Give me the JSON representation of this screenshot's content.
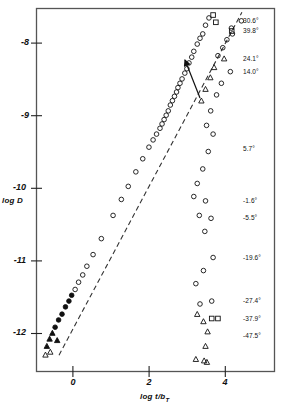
{
  "chart_data": {
    "type": "scatter",
    "title": "",
    "xlabel": "log t/bT",
    "xlabel_main": "log t/b",
    "xlabel_sub": "T",
    "ylabel": "log D",
    "xlim": [
      -1.6,
      5.3
    ],
    "ylim": [
      -12.45,
      -7.45
    ],
    "xticks": [
      0,
      2,
      4
    ],
    "xtick_labels": [
      "0",
      "2",
      "4"
    ],
    "yticks": [
      -8,
      -9,
      -10,
      -11,
      -12
    ],
    "ytick_labels": [
      "-8",
      "-9",
      "-10",
      "-11",
      "-12"
    ],
    "grid": false,
    "legend_position": "right-inside",
    "annotations": [
      {
        "name": "master-curve-arrow",
        "text": "",
        "x": 3.05,
        "y": -7.85
      }
    ],
    "master_curve": {
      "name": "master curve",
      "style": "dashed",
      "x": [
        -1.35,
        3.45
      ],
      "y": [
        -12.3,
        -7.5
      ]
    },
    "series": [
      {
        "name": "30.6",
        "label": "30.6°",
        "label_y": -7.62,
        "marker": "circle",
        "points": [
          [
            4.34,
            -7.62
          ],
          [
            4.05,
            -7.72
          ],
          [
            4.08,
            -7.8
          ],
          [
            3.92,
            -7.88
          ],
          [
            3.8,
            -7.99
          ],
          [
            3.66,
            -8.1
          ]
        ]
      },
      {
        "name": "39.8",
        "label": "39.8°",
        "label_y": -7.76,
        "marker": "square",
        "points": [
          [
            3.52,
            -7.54
          ],
          [
            4.06,
            -7.76
          ],
          [
            3.6,
            -7.64
          ]
        ]
      },
      {
        "name": "24.1",
        "label": "24.1°",
        "label_y": -8.14,
        "marker": "triangle",
        "points": [
          [
            3.84,
            -8.14
          ],
          [
            3.55,
            -8.26
          ],
          [
            3.44,
            -8.4
          ],
          [
            3.3,
            -8.56
          ],
          [
            3.18,
            -8.72
          ]
        ]
      },
      {
        "name": "14.0",
        "label": "14.0°",
        "label_y": -8.32,
        "marker": "circle",
        "points": [
          [
            4.02,
            -8.32
          ],
          [
            3.76,
            -8.48
          ],
          [
            3.62,
            -8.64
          ],
          [
            3.45,
            -8.86
          ],
          [
            3.33,
            -9.06
          ]
        ]
      },
      {
        "name": "5.7",
        "label": "5.7°",
        "label_y": -9.38,
        "marker": "circle",
        "points": [
          [
            3.52,
            -9.18
          ],
          [
            3.38,
            -9.42
          ],
          [
            3.22,
            -9.66
          ],
          [
            3.06,
            -9.86
          ],
          [
            2.96,
            -10.04
          ]
        ]
      },
      {
        "name": "-1.6",
        "label": "-1.6°",
        "label_y": -10.1,
        "marker": "circle",
        "points": [
          [
            3.3,
            -10.1
          ],
          [
            3.12,
            -10.3
          ]
        ]
      },
      {
        "name": "-5.5",
        "label": "-5.5°",
        "label_y": -10.34,
        "marker": "circle",
        "points": [
          [
            3.46,
            -10.34
          ],
          [
            3.28,
            -10.52
          ]
        ]
      },
      {
        "name": "-19.6",
        "label": "-19.6°",
        "label_y": -10.88,
        "marker": "circle",
        "points": [
          [
            3.52,
            -10.88
          ],
          [
            3.24,
            -11.06
          ],
          [
            3.02,
            -11.24
          ]
        ]
      },
      {
        "name": "-27.4",
        "label": "-27.4°",
        "label_y": -11.48,
        "marker": "circle",
        "points": [
          [
            3.48,
            -11.48
          ],
          [
            3.14,
            -11.52
          ]
        ]
      },
      {
        "name": "-37.9",
        "label": "-37.9°",
        "label_y": -11.72,
        "marker": "square",
        "points": [
          [
            3.48,
            -11.72
          ],
          [
            3.66,
            -11.72
          ]
        ]
      },
      {
        "name": "-47.5",
        "label": "-47.5°",
        "label_y": -11.96,
        "marker": "triangle",
        "points": [
          [
            3.06,
            -11.66
          ],
          [
            3.24,
            -11.76
          ],
          [
            3.36,
            -11.9
          ],
          [
            3.3,
            -12.1
          ],
          [
            3.02,
            -12.28
          ],
          [
            3.26,
            -12.3
          ],
          [
            3.34,
            -12.32
          ]
        ]
      }
    ],
    "overlay_points": {
      "name": "collapsed master data",
      "marker": "mixed open/filled circles and triangles",
      "points": [
        [
          3.4,
          -7.58
        ],
        [
          3.3,
          -7.68
        ],
        [
          3.22,
          -7.8
        ],
        [
          3.14,
          -7.86
        ],
        [
          3.06,
          -7.94
        ],
        [
          2.96,
          -8.04
        ],
        [
          2.9,
          -8.12
        ],
        [
          2.82,
          -8.2
        ],
        [
          2.76,
          -8.28
        ],
        [
          2.7,
          -8.34
        ],
        [
          2.62,
          -8.42
        ],
        [
          2.56,
          -8.48
        ],
        [
          2.5,
          -8.54
        ],
        [
          2.46,
          -8.6
        ],
        [
          2.4,
          -8.66
        ],
        [
          2.34,
          -8.72
        ],
        [
          2.28,
          -8.78
        ],
        [
          2.22,
          -8.86
        ],
        [
          2.16,
          -8.92
        ],
        [
          2.1,
          -8.98
        ],
        [
          2.04,
          -9.04
        ],
        [
          1.98,
          -9.1
        ],
        [
          1.88,
          -9.18
        ],
        [
          1.78,
          -9.26
        ],
        [
          1.66,
          -9.36
        ],
        [
          1.48,
          -9.52
        ],
        [
          1.28,
          -9.7
        ],
        [
          1.06,
          -9.9
        ],
        [
          0.86,
          -10.08
        ],
        [
          0.62,
          -10.3
        ],
        [
          0.28,
          -10.62
        ],
        [
          0.04,
          -10.84
        ],
        [
          -0.14,
          -11.0
        ],
        [
          -0.26,
          -11.12
        ],
        [
          -0.38,
          -11.22
        ],
        [
          -0.48,
          -11.32
        ],
        [
          -0.58,
          -11.4
        ],
        [
          -0.66,
          -11.48
        ],
        [
          -0.76,
          -11.56
        ],
        [
          -0.86,
          -11.66
        ],
        [
          -0.96,
          -11.74
        ],
        [
          -1.06,
          -11.84
        ],
        [
          -1.14,
          -11.92
        ],
        [
          -1.22,
          -12.0
        ],
        [
          -1.3,
          -12.1
        ],
        [
          -1.34,
          -12.22
        ],
        [
          -1.2,
          -12.18
        ],
        [
          -1.0,
          -12.02
        ]
      ]
    }
  },
  "axes": {
    "y_title": "log D",
    "x_title_main": "log t/b",
    "x_title_sub": "T"
  }
}
